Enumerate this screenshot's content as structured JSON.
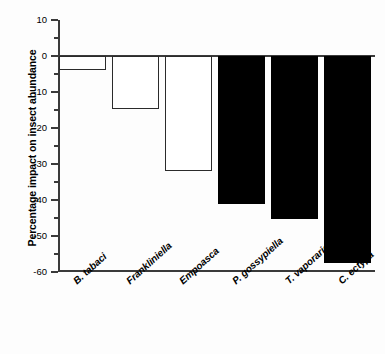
{
  "chart_data": {
    "type": "bar",
    "title": "",
    "xlabel": "",
    "ylabel": "Percentage impact on insect abundance",
    "categories": [
      "B. tabaci",
      "Frankliniella",
      "Empoasca",
      "P. gossypiella",
      "T. vaporariorum",
      "C. ectypa"
    ],
    "values": [
      -4,
      -14.8,
      -32,
      -41.2,
      -45.2,
      -57.5
    ],
    "bar_styles": [
      "hollow",
      "hollow",
      "hollow",
      "filled",
      "filled",
      "filled"
    ],
    "ylim": [
      -60,
      10
    ],
    "yticks": [
      10,
      0,
      -10,
      -20,
      -30,
      -40,
      -50,
      -60
    ],
    "ytick_labels": [
      "10",
      "0",
      "-10",
      "-20",
      "-30",
      "-40",
      "-50",
      "-60"
    ],
    "yminor_ticks": [
      5,
      -5,
      -15,
      -25,
      -35,
      -45,
      -55
    ],
    "grid": false,
    "legend": null,
    "colors": {
      "hollow_fill": "#ffffff",
      "hollow_edge": "#2b2b2b",
      "filled_fill": "#000000",
      "axis": "#3a3a3a",
      "background": "#fdfdfd"
    }
  }
}
